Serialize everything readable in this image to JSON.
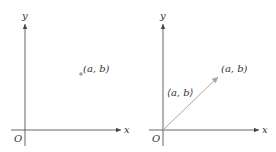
{
  "left_panel": {
    "x_axis_label": "x",
    "y_axis_label": "y",
    "origin_label": "O",
    "point_label": "(a, b)",
    "colors": {
      "axis": "#555555",
      "point": "#a0a0a0"
    }
  },
  "right_panel": {
    "x_axis_label": "x",
    "y_axis_label": "y",
    "origin_label": "O",
    "point_label": "(a, b)",
    "vector_label": "⟨a, b⟩",
    "colors": {
      "axis": "#555555",
      "vector": "#a8a8a8"
    }
  }
}
